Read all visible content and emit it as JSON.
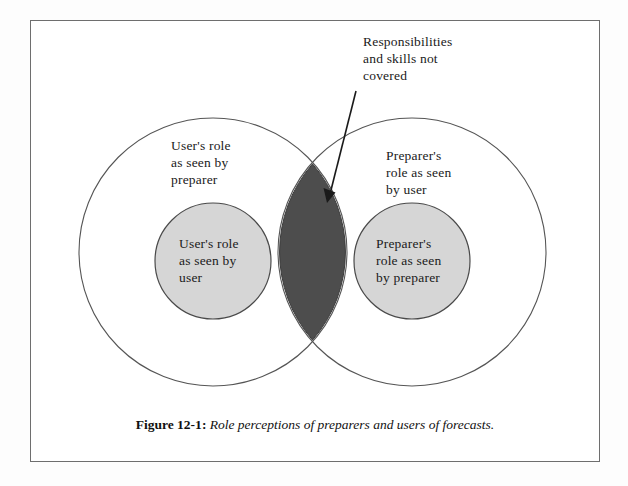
{
  "figure": {
    "callout": {
      "text": "Responsibilities\nand skills not\ncovered",
      "arrow_name": "callout-arrow"
    },
    "regions": {
      "outer_left_label": "User's role\nas seen by\npreparer",
      "outer_right_label": "Preparer's\nrole as seen\nby user",
      "inner_left_label": "User's role\nas seen by\nuser",
      "inner_right_label": "Preparer's\nrole as seen\nby preparer",
      "overlap_label": "Responsibilities and skills not covered"
    },
    "caption": {
      "number": "Figure 12-1",
      "separator": ":",
      "text": "Role perceptions of preparers and users of forecasts."
    },
    "colors": {
      "page_background": "#ffffff",
      "frame_border": "#6e6e6e",
      "big_circle_stroke": "#555555",
      "inner_circle_fill": "#d6d6d6",
      "inner_circle_stroke": "#4a4a4a",
      "overlap_fill": "#4d4d4d",
      "text": "#1a1a1a"
    },
    "geometry": {
      "big_circle_left_cx": 182,
      "big_circle_right_cx": 381,
      "big_circle_cy": 231,
      "big_circle_r": 134,
      "inner_circle_left_cx": 182,
      "inner_circle_right_cx": 381,
      "inner_circle_cy": 240,
      "inner_circle_r": 58
    }
  }
}
